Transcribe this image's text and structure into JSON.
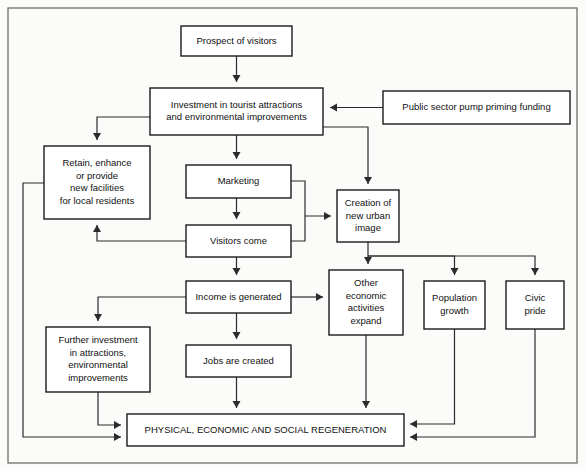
{
  "diagram": {
    "colors": {
      "box_fill": "#ffffff",
      "box_stroke": "#1a1a1a",
      "edge_stroke": "#2b2b2b",
      "frame_stroke": "#6e6e6e",
      "page_background": "#fbfbf9",
      "text": "#111111"
    },
    "frame": {
      "x": 8,
      "y": 8,
      "width": 569,
      "height": 455
    },
    "nodes": [
      {
        "id": "prospect",
        "name": "prospect-of-visitors",
        "lines": [
          "Prospect of visitors"
        ],
        "x": 181,
        "y": 26,
        "width": 111,
        "height": 30,
        "font_size": 9.5
      },
      {
        "id": "investment",
        "name": "investment-in-tourist-attractions",
        "lines": [
          "Investment in tourist attractions",
          "and environmental improvements"
        ],
        "x": 150,
        "y": 88,
        "width": 173,
        "height": 47,
        "font_size": 9.5
      },
      {
        "id": "public-funding",
        "name": "public-sector-pump-priming-funding",
        "lines": [
          "Public sector pump priming funding"
        ],
        "x": 383,
        "y": 91,
        "width": 187,
        "height": 33,
        "font_size": 9.5
      },
      {
        "id": "retain",
        "name": "retain-enhance-or-provide-new-facilities",
        "lines": [
          "Retain, enhance",
          "or provide",
          "new facilities",
          "for local residents"
        ],
        "x": 44,
        "y": 146,
        "width": 106,
        "height": 73,
        "font_size": 9.5
      },
      {
        "id": "marketing",
        "name": "marketing",
        "lines": [
          "Marketing"
        ],
        "x": 186,
        "y": 165,
        "width": 105,
        "height": 33,
        "font_size": 9.5
      },
      {
        "id": "creation",
        "name": "creation-of-new-urban-image",
        "lines": [
          "Creation of",
          "new urban",
          "image"
        ],
        "x": 337,
        "y": 190,
        "width": 62,
        "height": 52,
        "font_size": 9.5
      },
      {
        "id": "visitors-come",
        "name": "visitors-come",
        "lines": [
          "Visitors come"
        ],
        "x": 186,
        "y": 225,
        "width": 105,
        "height": 32,
        "font_size": 9.5
      },
      {
        "id": "other-economic",
        "name": "other-economic-activities-expand",
        "lines": [
          "Other",
          "economic",
          "activities",
          "expand"
        ],
        "x": 329,
        "y": 270,
        "width": 74,
        "height": 65,
        "font_size": 9.5
      },
      {
        "id": "population",
        "name": "population-growth",
        "lines": [
          "Population",
          "growth"
        ],
        "x": 424,
        "y": 281,
        "width": 61,
        "height": 48,
        "font_size": 9.5
      },
      {
        "id": "civic-pride",
        "name": "civic-pride",
        "lines": [
          "Civic",
          "pride"
        ],
        "x": 506,
        "y": 281,
        "width": 58,
        "height": 48,
        "font_size": 9.5
      },
      {
        "id": "income",
        "name": "income-is-generated",
        "lines": [
          "Income is generated"
        ],
        "x": 186,
        "y": 281,
        "width": 105,
        "height": 32,
        "font_size": 9.5
      },
      {
        "id": "further-investment",
        "name": "further-investment-in-attractions",
        "lines": [
          "Further investment",
          "in attractions,",
          "environmental",
          "improvements"
        ],
        "x": 46,
        "y": 327,
        "width": 104,
        "height": 65,
        "font_size": 9.5
      },
      {
        "id": "jobs",
        "name": "jobs-are-created",
        "lines": [
          "Jobs are created"
        ],
        "x": 186,
        "y": 345,
        "width": 105,
        "height": 32,
        "font_size": 9.5
      },
      {
        "id": "regeneration",
        "name": "physical-economic-and-social-regeneration",
        "lines": [
          "PHYSICAL, ECONOMIC AND SOCIAL REGENERATION"
        ],
        "x": 127,
        "y": 414,
        "width": 277,
        "height": 32,
        "font_size": 9.5
      }
    ],
    "edges": [
      {
        "id": "e1",
        "name": "edge-prospect-to-investment",
        "from": "prospect",
        "to": "investment",
        "path": "M 236.5 56 L 236.5 82",
        "arrow": "down"
      },
      {
        "id": "e2",
        "name": "edge-funding-to-investment",
        "from": "public-funding",
        "to": "investment",
        "path": "M 383 107.5 L 330 107.5",
        "arrow": "left"
      },
      {
        "id": "e3",
        "name": "edge-investment-to-retain",
        "from": "investment",
        "to": "retain",
        "path": "M 150 117 L 97 117 L 97 140",
        "arrow": "down"
      },
      {
        "id": "e4",
        "name": "edge-investment-to-marketing",
        "from": "investment",
        "to": "marketing",
        "path": "M 236.5 135 L 236.5 159",
        "arrow": "down"
      },
      {
        "id": "e5",
        "name": "edge-investment-to-creation",
        "from": "investment",
        "to": "creation",
        "path": "M 323 127 L 368 127 L 368 184",
        "arrow": "down"
      },
      {
        "id": "e6",
        "name": "edge-marketing-to-visitors",
        "from": "marketing",
        "to": "visitors-come",
        "path": "M 236.5 198 L 236.5 219",
        "arrow": "down"
      },
      {
        "id": "e7",
        "name": "edge-marketing-and-visitors-to-creation",
        "from": "marketing",
        "to": "creation",
        "path": "M 291 181 L 305 181 L 305 216 M 291 241 L 305 241 L 305 216 M 305 216 L 331 216",
        "arrow": "right"
      },
      {
        "id": "e8",
        "name": "edge-visitors-to-retain",
        "from": "visitors-come",
        "to": "retain",
        "path": "M 186 241 L 97 241 L 97 225",
        "arrow": "up"
      },
      {
        "id": "e9",
        "name": "edge-visitors-to-income",
        "from": "visitors-come",
        "to": "income",
        "path": "M 236.5 257 L 236.5 275",
        "arrow": "down"
      },
      {
        "id": "e10",
        "name": "edge-creation-to-other-economic",
        "from": "creation",
        "to": "other-economic",
        "path": "M 368 242 L 368 264",
        "arrow": "down"
      },
      {
        "id": "e11",
        "name": "edge-creation-to-population",
        "from": "creation",
        "to": "population",
        "path": "M 368 256 L 454.5 256 L 454.5 275",
        "arrow": "down"
      },
      {
        "id": "e12",
        "name": "edge-creation-to-civic-pride",
        "from": "creation",
        "to": "civic-pride",
        "path": "M 368 256 L 535 256 L 535 275",
        "arrow": "down"
      },
      {
        "id": "e13",
        "name": "edge-income-to-other-economic",
        "from": "income",
        "to": "other-economic",
        "path": "M 291 297 L 323 297",
        "arrow": "right"
      },
      {
        "id": "e14",
        "name": "edge-income-to-further-investment",
        "from": "income",
        "to": "further-investment",
        "path": "M 186 297 L 98 297 L 98 321",
        "arrow": "down"
      },
      {
        "id": "e15",
        "name": "edge-income-to-jobs",
        "from": "income",
        "to": "jobs",
        "path": "M 236.5 313 L 236.5 339",
        "arrow": "down"
      },
      {
        "id": "e16",
        "name": "edge-jobs-to-regeneration",
        "from": "jobs",
        "to": "regeneration",
        "path": "M 236.5 377 L 236.5 408",
        "arrow": "down"
      },
      {
        "id": "e17",
        "name": "edge-other-economic-to-regeneration",
        "from": "other-economic",
        "to": "regeneration",
        "path": "M 366 335 L 366 408",
        "arrow": "down"
      },
      {
        "id": "e18",
        "name": "edge-further-investment-to-regeneration",
        "from": "further-investment",
        "to": "regeneration",
        "path": "M 98 392 L 98 425 L 121 425",
        "arrow": "right"
      },
      {
        "id": "e19",
        "name": "edge-retain-to-regeneration",
        "from": "retain",
        "to": "regeneration",
        "path": "M 44 183 L 23 183 L 23 437 L 121 437",
        "arrow": "right"
      },
      {
        "id": "e20",
        "name": "edge-population-to-regeneration",
        "from": "population",
        "to": "regeneration",
        "path": "M 454.5 329 L 454.5 424 L 410 424",
        "arrow": "left"
      },
      {
        "id": "e21",
        "name": "edge-civic-pride-to-regeneration",
        "from": "civic-pride",
        "to": "regeneration",
        "path": "M 535 329 L 535 437 L 410 437",
        "arrow": "left"
      }
    ]
  }
}
